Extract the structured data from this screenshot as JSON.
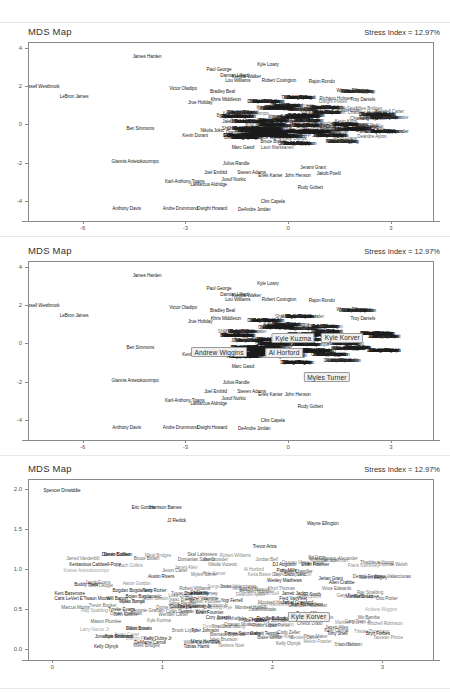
{
  "page": {
    "width": 450,
    "height": 692,
    "background": "#ffffff"
  },
  "panels": [
    {
      "id": "panel-1",
      "title": "MDS Map",
      "stress_label": "Stress Index = 12.97%",
      "x_ticks": [
        "-6",
        "-3",
        "0",
        "3"
      ],
      "y_ticks": [
        "4",
        "2",
        "0",
        "-2",
        "-4"
      ]
    },
    {
      "id": "panel-2",
      "title": "MDS Map",
      "stress_label": "Stress Index = 12.97%",
      "x_ticks": [
        "-6",
        "-3",
        "0",
        "3"
      ],
      "y_ticks": [
        "4",
        "2",
        "0",
        "-2",
        "-4"
      ]
    },
    {
      "id": "panel-3",
      "title": "MDS Map",
      "stress_label": "Stress Index = 12.97%",
      "x_ticks": [
        "0",
        "1",
        "2",
        "3"
      ],
      "y_ticks": [
        "2.0",
        "1.5",
        "1.0",
        "0.5",
        "0.0"
      ]
    }
  ],
  "chart_data": [
    {
      "type": "scatter",
      "title": "MDS Map",
      "subtitle": "Stress Index = 12.97%",
      "xlabel": "",
      "ylabel": "",
      "xlim": [
        -7.6,
        4.2
      ],
      "ylim": [
        -5.0,
        4.3
      ],
      "grid": false,
      "legend": null,
      "xticks": [
        -6,
        -3,
        0,
        3
      ],
      "yticks": [
        4,
        2,
        0,
        -2,
        -4
      ],
      "annotation_style": "point-labels",
      "points": [
        {
          "label": "James Harden",
          "x": -4.15,
          "y": 3.62
        },
        {
          "label": "Russell Westbrook",
          "x": -7.25,
          "y": 2.05
        },
        {
          "label": "LeBron James",
          "x": -6.28,
          "y": 1.52
        },
        {
          "label": "Paul George",
          "x": -2.05,
          "y": 2.92
        },
        {
          "label": "Kyle Lowry",
          "x": -0.62,
          "y": 3.18
        },
        {
          "label": "Damian Lillard",
          "x": -1.6,
          "y": 2.62
        },
        {
          "label": "Kemba Walker",
          "x": -1.25,
          "y": 2.6
        },
        {
          "label": "Lou Williams",
          "x": -1.5,
          "y": 2.38
        },
        {
          "label": "Robert Covington",
          "x": -0.3,
          "y": 2.35
        },
        {
          "label": "Rajon Rondo",
          "x": 0.95,
          "y": 2.3
        },
        {
          "label": "Victor Oladipo",
          "x": -3.1,
          "y": 1.95
        },
        {
          "label": "Bradley Beal",
          "x": -1.95,
          "y": 1.8
        },
        {
          "label": "Wayne Ellington",
          "x": 1.85,
          "y": 1.85
        },
        {
          "label": "Khris Middleton",
          "x": -1.85,
          "y": 1.4
        },
        {
          "label": "Jrue Holiday",
          "x": -2.6,
          "y": 1.22
        },
        {
          "label": "Troy Daniels",
          "x": 2.15,
          "y": 1.35
        },
        {
          "label": "Ben Simmons",
          "x": -4.35,
          "y": -0.12
        },
        {
          "label": "Nikola Jokic",
          "x": -2.25,
          "y": -0.22
        },
        {
          "label": "Kevin Durant",
          "x": -2.75,
          "y": -0.52
        },
        {
          "label": "Draymond Green",
          "x": -1.35,
          "y": -0.35
        },
        {
          "label": "DeMarcus Cousins",
          "x": -1.35,
          "y": -0.62
        },
        {
          "label": "Thaddeus Young",
          "x": -0.72,
          "y": -0.6
        },
        {
          "label": "Marc Gasol",
          "x": -1.35,
          "y": -1.15
        },
        {
          "label": "Giannis Antetokounmpo",
          "x": -4.5,
          "y": -1.85
        },
        {
          "label": "Julius Randle",
          "x": -1.55,
          "y": -1.95
        },
        {
          "label": "Joel Embiid",
          "x": -2.15,
          "y": -2.45
        },
        {
          "label": "Steven Adams",
          "x": -1.1,
          "y": -2.42
        },
        {
          "label": "Jerami Grant",
          "x": 0.7,
          "y": -2.2
        },
        {
          "label": "Enes Kanter",
          "x": -0.55,
          "y": -2.62
        },
        {
          "label": "John Henson",
          "x": 0.25,
          "y": -2.62
        },
        {
          "label": "Jakob Poeltl",
          "x": 1.15,
          "y": -2.5
        },
        {
          "label": "Karl-Anthony Towns",
          "x": -3.05,
          "y": -2.92
        },
        {
          "label": "Jusuf Nurkic",
          "x": -1.62,
          "y": -2.82
        },
        {
          "label": "LaMarcus Aldridge",
          "x": -2.35,
          "y": -3.05
        },
        {
          "label": "Rudy Gobert",
          "x": 0.62,
          "y": -3.22
        },
        {
          "label": "Clint Capela",
          "x": -0.48,
          "y": -3.95
        },
        {
          "label": "Anthony Davis",
          "x": -4.75,
          "y": -4.3
        },
        {
          "label": "Andre Drummond",
          "x": -3.18,
          "y": -4.3
        },
        {
          "label": "Dwight Howard",
          "x": -2.25,
          "y": -4.3
        },
        {
          "label": "DeAndre Jordan",
          "x": -1.02,
          "y": -4.35
        }
      ],
      "note": "Dense central cluster of ~400 additional overlapping NBA player name labels, unreadable at this resolution."
    },
    {
      "type": "scatter",
      "title": "MDS Map",
      "subtitle": "Stress Index = 12.97%",
      "xlabel": "",
      "ylabel": "",
      "xlim": [
        -7.6,
        4.2
      ],
      "ylim": [
        -5.0,
        4.3
      ],
      "grid": false,
      "legend": null,
      "xticks": [
        -6,
        -3,
        0,
        3
      ],
      "yticks": [
        4,
        2,
        0,
        -2,
        -4
      ],
      "annotation_style": "point-labels-with-highlights",
      "highlighted": [
        {
          "label": "Andrew Wiggins",
          "x": -2.05,
          "y": -0.42
        },
        {
          "label": "Al Horford",
          "x": -0.15,
          "y": -0.45
        },
        {
          "label": "Kyle Kuzma",
          "x": 0.12,
          "y": 0.32
        },
        {
          "label": "Kyle Korver",
          "x": 1.55,
          "y": 0.35
        },
        {
          "label": "Myles Turner",
          "x": 1.1,
          "y": -1.72
        }
      ],
      "points": [
        {
          "label": "James Harden",
          "x": -4.15,
          "y": 3.62
        },
        {
          "label": "Russell Westbrook",
          "x": -7.25,
          "y": 2.05
        },
        {
          "label": "LeBron James",
          "x": -6.28,
          "y": 1.52
        },
        {
          "label": "Paul George",
          "x": -2.05,
          "y": 2.92
        },
        {
          "label": "Kyle Lowry",
          "x": -0.62,
          "y": 3.18
        },
        {
          "label": "Damian Lillard",
          "x": -1.6,
          "y": 2.62
        },
        {
          "label": "Kemba Walker",
          "x": -1.25,
          "y": 2.6
        },
        {
          "label": "Lou Williams",
          "x": -1.5,
          "y": 2.38
        },
        {
          "label": "Robert Covington",
          "x": -0.3,
          "y": 2.35
        },
        {
          "label": "Rajon Rondo",
          "x": 0.95,
          "y": 2.3
        },
        {
          "label": "Victor Oladipo",
          "x": -3.1,
          "y": 1.95
        },
        {
          "label": "Bradley Beal",
          "x": -1.95,
          "y": 1.8
        },
        {
          "label": "Wayne Ellington",
          "x": 1.85,
          "y": 1.85
        },
        {
          "label": "Khris Middleton",
          "x": -1.85,
          "y": 1.4
        },
        {
          "label": "Jrue Holiday",
          "x": -2.6,
          "y": 1.22
        },
        {
          "label": "Troy Daniels",
          "x": 2.15,
          "y": 1.35
        },
        {
          "label": "Ben Simmons",
          "x": -4.35,
          "y": -0.12
        },
        {
          "label": "Nikola Jokic",
          "x": -2.25,
          "y": -0.22
        },
        {
          "label": "Kevin Durant",
          "x": -2.75,
          "y": -0.52
        },
        {
          "label": "Thaddeus Young",
          "x": -0.72,
          "y": -0.6
        },
        {
          "label": "Otto Porter",
          "x": -0.42,
          "y": 0.15
        },
        {
          "label": "Terrance Ferguson",
          "x": 0.55,
          "y": -0.3
        },
        {
          "label": "Marc Gasol",
          "x": -1.35,
          "y": -1.15
        },
        {
          "label": "Giannis Antetokounmpo",
          "x": -4.5,
          "y": -1.85
        },
        {
          "label": "Julius Randle",
          "x": -1.55,
          "y": -1.95
        },
        {
          "label": "Joel Embiid",
          "x": -2.15,
          "y": -2.45
        },
        {
          "label": "Steven Adams",
          "x": -1.1,
          "y": -2.42
        },
        {
          "label": "Enes Kanter",
          "x": -0.55,
          "y": -2.62
        },
        {
          "label": "John Henson",
          "x": 0.25,
          "y": -2.62
        },
        {
          "label": "Karl-Anthony Towns",
          "x": -3.05,
          "y": -2.92
        },
        {
          "label": "Jusuf Nurkic",
          "x": -1.62,
          "y": -2.82
        },
        {
          "label": "LaMarcus Aldridge",
          "x": -2.35,
          "y": -3.05
        },
        {
          "label": "Rudy Gobert",
          "x": 0.62,
          "y": -3.22
        },
        {
          "label": "Clint Capela",
          "x": -0.48,
          "y": -3.95
        },
        {
          "label": "Anthony Davis",
          "x": -4.75,
          "y": -4.3
        },
        {
          "label": "Andre Drummond",
          "x": -3.18,
          "y": -4.3
        },
        {
          "label": "Dwight Howard",
          "x": -2.25,
          "y": -4.3
        },
        {
          "label": "DeAndre Jordan",
          "x": -1.02,
          "y": -4.35
        }
      ],
      "note": "Same MDS projection as panel 1, with five player labels highlighted in boxed callouts."
    },
    {
      "type": "scatter",
      "title": "MDS Map",
      "subtitle": "Stress Index = 12.97%",
      "xlabel": "",
      "ylabel": "",
      "xlim": [
        -0.22,
        3.45
      ],
      "ylim": [
        -0.12,
        2.12
      ],
      "grid": false,
      "legend": null,
      "xticks": [
        0,
        1,
        2,
        3
      ],
      "yticks": [
        0.0,
        0.5,
        1.0,
        1.5,
        2.0
      ],
      "annotation_style": "point-labels-with-highlights",
      "highlighted": [
        {
          "label": "Kyle Korver",
          "x": 2.32,
          "y": 0.42
        }
      ],
      "points": [
        {
          "label": "Spencer Dinwiddie",
          "x": 0.08,
          "y": 2.0
        },
        {
          "label": "Eric Gordon",
          "x": 0.82,
          "y": 1.78
        },
        {
          "label": "Harrison Barnes",
          "x": 1.02,
          "y": 1.78
        },
        {
          "label": "JJ Redick",
          "x": 1.12,
          "y": 1.62
        },
        {
          "label": "Wayne Ellington",
          "x": 2.45,
          "y": 1.58
        },
        {
          "label": "Trevor Ariza",
          "x": 1.92,
          "y": 1.3
        },
        {
          "label": "Darren Collison",
          "x": 0.58,
          "y": 1.2
        },
        {
          "label": "Devin Booker",
          "x": 0.58,
          "y": 1.2
        },
        {
          "label": "Kentavious Caldwell-Pope",
          "x": 0.38,
          "y": 1.08
        },
        {
          "label": "DJ Augustin",
          "x": 2.1,
          "y": 1.08
        },
        {
          "label": "Evan Fournier",
          "x": 2.38,
          "y": 1.08
        },
        {
          "label": "Patty Mills",
          "x": 2.12,
          "y": 1.0
        },
        {
          "label": "Austin Rivers",
          "x": 0.98,
          "y": 0.93
        },
        {
          "label": "Jerian Grant",
          "x": 2.52,
          "y": 0.9
        },
        {
          "label": "Allen Crabbe",
          "x": 2.62,
          "y": 0.85
        },
        {
          "label": "Wesley Matthews",
          "x": 2.1,
          "y": 0.88
        },
        {
          "label": "Buddy Hield",
          "x": 0.3,
          "y": 0.83
        },
        {
          "label": "Bogdan Bogdanovic",
          "x": 0.72,
          "y": 0.75
        },
        {
          "label": "Terry Rozier",
          "x": 0.92,
          "y": 0.75
        },
        {
          "label": "Jrue Holiday",
          "x": 1.3,
          "y": 0.72
        },
        {
          "label": "Kent Bazemore",
          "x": 0.15,
          "y": 0.72
        },
        {
          "label": "JR Smith",
          "x": 2.35,
          "y": 0.7
        },
        {
          "label": "Bojan Bogdanovic",
          "x": 0.82,
          "y": 0.68
        },
        {
          "label": "Caris LeVert",
          "x": 0.12,
          "y": 0.65
        },
        {
          "label": "E'Twaun Moore",
          "x": 0.38,
          "y": 0.65
        },
        {
          "label": "Will Barton",
          "x": 0.58,
          "y": 0.65
        },
        {
          "label": "Denzel Valentine",
          "x": 1.35,
          "y": 0.65
        },
        {
          "label": "Yogi Ferrell",
          "x": 1.62,
          "y": 0.63
        },
        {
          "label": "Marcus Smart",
          "x": 2.78,
          "y": 0.68
        },
        {
          "label": "Jamal Crawford",
          "x": 2.22,
          "y": 0.6
        },
        {
          "label": "Fred VanVleet",
          "x": 2.18,
          "y": 0.65
        },
        {
          "label": "Tim Hardaway Jr",
          "x": 1.28,
          "y": 0.55
        },
        {
          "label": "Courtney Lee",
          "x": 1.18,
          "y": 0.55
        },
        {
          "label": "Josh Richardson",
          "x": 2.3,
          "y": 0.58
        },
        {
          "label": "Tyreke Evans",
          "x": 0.62,
          "y": 0.52
        },
        {
          "label": "Evan Fournier",
          "x": 1.42,
          "y": 0.48
        },
        {
          "label": "Cory Joseph",
          "x": 1.5,
          "y": 0.42
        },
        {
          "label": "Reggie Bullock",
          "x": 1.98,
          "y": 0.4
        },
        {
          "label": "Darius Miller",
          "x": 2.32,
          "y": 0.47
        },
        {
          "label": "Joe Harris",
          "x": 1.82,
          "y": 0.38
        },
        {
          "label": "Stanley Johnson",
          "x": 1.98,
          "y": 0.38
        },
        {
          "label": "Dillon Brooks",
          "x": 0.78,
          "y": 0.28
        },
        {
          "label": "Tyler Johnson",
          "x": 1.38,
          "y": 0.25
        },
        {
          "label": "Jonathon Simmons",
          "x": 0.55,
          "y": 0.18
        },
        {
          "label": "Kyle Anderson",
          "x": 0.6,
          "y": 0.18
        },
        {
          "label": "Kelly Oubre Jr",
          "x": 0.95,
          "y": 0.15
        },
        {
          "label": "DeMarre Carroll",
          "x": 0.88,
          "y": 0.1
        },
        {
          "label": "Mario Hezonja",
          "x": 1.38,
          "y": 0.12
        },
        {
          "label": "Kelly Olynyk",
          "x": 0.48,
          "y": 0.05
        },
        {
          "label": "Tomas Satoransky",
          "x": 1.72,
          "y": 0.22
        },
        {
          "label": "Garrett Temple",
          "x": 1.92,
          "y": 0.22
        },
        {
          "label": "Tony Snell",
          "x": 2.58,
          "y": 0.22
        },
        {
          "label": "Bryn Forbes",
          "x": 2.95,
          "y": 0.22
        },
        {
          "label": "Jarrett Jack",
          "x": 2.18,
          "y": 0.72
        },
        {
          "label": "Tobias Harris",
          "x": 1.3,
          "y": 0.05
        }
      ],
      "note": "Zoomed-in region of the MDS map showing role players; one highlighted boxed label."
    }
  ]
}
